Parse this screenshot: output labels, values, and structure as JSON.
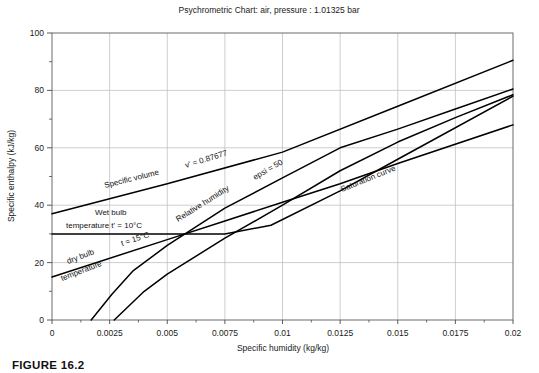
{
  "figure": {
    "caption": "FIGURE 16.2"
  },
  "chart_data": {
    "type": "line",
    "title": "Psychrometric Chart: air, pressure : 1.01325 bar",
    "xlabel": "Specific humidity (kg/kg)",
    "ylabel": "Specific enthalpy (kJ/kg)",
    "xlim": [
      0,
      0.02
    ],
    "ylim": [
      0,
      100
    ],
    "grid": true,
    "legend_position": "inline-annotations",
    "xticks": [
      0,
      0.0025,
      0.005,
      0.0075,
      0.01,
      0.0125,
      0.015,
      0.0175,
      0.02
    ],
    "xtick_labels": [
      "0",
      "0.0025",
      "0.005",
      "0.0075",
      "0.01",
      "0.0125",
      "0.015",
      "0.0175",
      "0.02"
    ],
    "yticks": [
      0,
      20,
      40,
      60,
      80,
      100
    ],
    "ytick_labels": [
      "0",
      "20",
      "40",
      "60",
      "80",
      "100"
    ],
    "yticks_minor": [
      10,
      30,
      50,
      70,
      90
    ],
    "series": [
      {
        "name": "Specific volume v' = 0.87677",
        "label": "Specific volume",
        "value_label": "v' = 0.87677",
        "points": [
          [
            0,
            37.0
          ],
          [
            0.005,
            47.5
          ],
          [
            0.01,
            58.5
          ],
          [
            0.015,
            74.5
          ],
          [
            0.02,
            90.5
          ]
        ]
      },
      {
        "name": "Wet bulb temperature t' = 10°C",
        "label": "Wet bulb temperature t' = 10°C",
        "points": [
          [
            0,
            30.0
          ],
          [
            0.0075,
            30.0
          ],
          [
            0.0095,
            33.0
          ],
          [
            0.0125,
            45.0
          ],
          [
            0.015,
            56.0
          ],
          [
            0.02,
            78.0
          ]
        ]
      },
      {
        "name": "Relative humidity epsi = 50",
        "label": "Relative humidity",
        "value_label": "epsi = 50",
        "points": [
          [
            0.0017,
            0.0
          ],
          [
            0.0026,
            9.0
          ],
          [
            0.0035,
            17.0
          ],
          [
            0.005,
            26.0
          ],
          [
            0.0075,
            39.0
          ],
          [
            0.01,
            49.5
          ],
          [
            0.0125,
            60.0
          ],
          [
            0.015,
            66.5
          ],
          [
            0.0175,
            73.5
          ],
          [
            0.02,
            80.5
          ]
        ]
      },
      {
        "name": "Saturation curve",
        "label": "Saturation curve",
        "points": [
          [
            0.0027,
            0.0
          ],
          [
            0.004,
            10.0
          ],
          [
            0.005,
            16.0
          ],
          [
            0.0075,
            28.5
          ],
          [
            0.01,
            40.0
          ],
          [
            0.0125,
            52.0
          ],
          [
            0.015,
            62.0
          ],
          [
            0.0175,
            70.5
          ],
          [
            0.02,
            78.5
          ]
        ]
      },
      {
        "name": "dry bulb temperature t = 15°C",
        "label": "dry bulb temperature",
        "value_label": "t = 15°C",
        "points": [
          [
            0,
            15.0
          ],
          [
            0.005,
            28.0
          ],
          [
            0.0075,
            34.5
          ],
          [
            0.01,
            41.0
          ],
          [
            0.0125,
            47.5
          ],
          [
            0.015,
            54.5
          ],
          [
            0.02,
            68.0
          ]
        ]
      }
    ],
    "annotations": [
      {
        "name": "specific-volume-annotation",
        "text": "Specific volume",
        "value": "v'  =  0.87677"
      },
      {
        "name": "wet-bulb-annotation-line1",
        "text": "Wet bulb"
      },
      {
        "name": "wet-bulb-annotation-line2",
        "text": "temperature t'  =  10°C"
      },
      {
        "name": "relative-humidity-annotation",
        "text": "Relative humidity",
        "value": "epsi  =  50"
      },
      {
        "name": "saturation-curve-annotation",
        "text": "Saturation curve"
      },
      {
        "name": "dry-bulb-annotation-line1",
        "text": "dry bulb"
      },
      {
        "name": "dry-bulb-annotation-line2",
        "text": "temperature"
      },
      {
        "name": "dry-bulb-temperature-value",
        "text": "t  =  15°C"
      }
    ]
  }
}
